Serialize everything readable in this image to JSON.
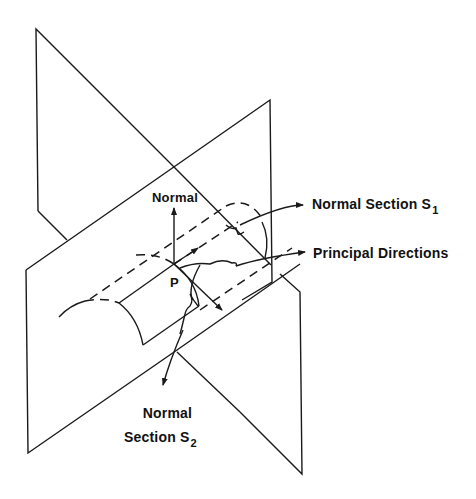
{
  "diagram": {
    "type": "geometry-illustration",
    "labels": {
      "normal": "Normal",
      "point": "P",
      "section1_main": "Normal Section S",
      "section1_sub": "1",
      "principal": "Principal Directions",
      "section2_line1": "Normal",
      "section2_main": "Section S",
      "section2_sub": "2"
    },
    "colors": {
      "stroke": "#1a1a1a",
      "background": "#ffffff"
    }
  }
}
